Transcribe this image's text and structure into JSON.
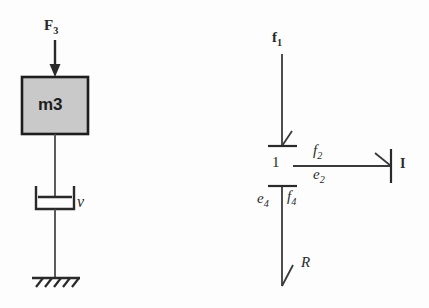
{
  "figure": {
    "background_color": "#fdfdfd",
    "ink_color": "#2a2a2a",
    "block_fill_color": "#c9c9c9",
    "block_border_color": "#1d1d1d"
  },
  "mechanical": {
    "force_label": "F",
    "force_subscript": "3",
    "mass_label": "m3",
    "damper_label": "v",
    "ground_name": "ground-hatch"
  },
  "bondgraph": {
    "junction_label": "1",
    "flow_in_label": "f",
    "flow_in_subscript": "1",
    "bond2_flow_label": "f",
    "bond2_flow_subscript": "2",
    "bond2_effort_label": "e",
    "bond2_effort_subscript": "2",
    "inertia_element_label": "I",
    "bond4_effort_label": "e",
    "bond4_effort_subscript": "4",
    "bond4_flow_label": "f",
    "bond4_flow_subscript": "4",
    "resistance_element_label": "R"
  }
}
